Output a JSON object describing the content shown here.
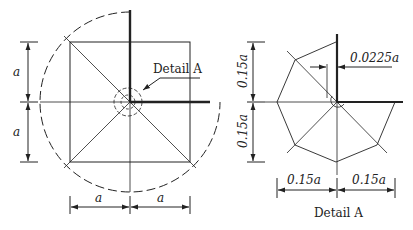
{
  "main_view": {
    "dim_vertical_upper": "a",
    "dim_vertical_lower": "a",
    "dim_horizontal_left": "a",
    "dim_horizontal_right": "a",
    "callout_label": "Detail A"
  },
  "detail_view": {
    "dim_vertical_upper": "0.15a",
    "dim_vertical_lower": "0.15a",
    "dim_horizontal_left": "0.15a",
    "dim_horizontal_right": "0.15a",
    "dim_offset": "0.0225a",
    "caption": "Detail A"
  },
  "colors": {
    "line": "#222222",
    "background": "#ffffff"
  }
}
